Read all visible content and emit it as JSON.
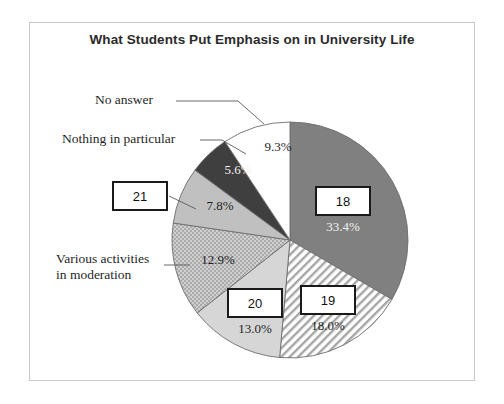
{
  "chart_data": {
    "type": "pie",
    "title": "What Students Put Emphasis on in University Life",
    "subtitle": "",
    "xlabel": "",
    "ylabel": "",
    "grid": false,
    "legend_position": "none",
    "total_percent": 100.0,
    "start_angle_deg": 0,
    "direction": "clockwise",
    "categories": [
      "18",
      "19",
      "20",
      "Various activities in moderation",
      "21",
      "Nothing in particular",
      "No answer"
    ],
    "values": [
      33.4,
      18.0,
      13.0,
      12.9,
      7.8,
      5.6,
      9.3
    ],
    "slices": [
      {
        "label": "18",
        "label_kind": "boxed-number",
        "percent": 33.4,
        "percent_text": "33.4%",
        "fill": "#808080",
        "pattern": "solid",
        "percent_text_color": "#f2f2f2"
      },
      {
        "label": "19",
        "label_kind": "boxed-number",
        "percent": 18.0,
        "percent_text": "18.0%",
        "fill": "#ffffff",
        "pattern": "diagonal-hatch",
        "percent_text_color": "#1f1f1f"
      },
      {
        "label": "20",
        "label_kind": "boxed-number",
        "percent": 13.0,
        "percent_text": "13.0%",
        "fill": "#d6d6d6",
        "pattern": "solid",
        "percent_text_color": "#1f1f1f"
      },
      {
        "label": "Various activities in moderation",
        "label_kind": "callout-text",
        "percent": 12.9,
        "percent_text": "12.9%",
        "fill": "#c4c4c4",
        "pattern": "stipple-dots",
        "percent_text_color": "#1f1f1f"
      },
      {
        "label": "21",
        "label_kind": "boxed-number",
        "percent": 7.8,
        "percent_text": "7.8%",
        "fill": "#c0c0c0",
        "pattern": "solid",
        "percent_text_color": "#1f1f1f"
      },
      {
        "label": "Nothing in particular",
        "label_kind": "callout-text",
        "percent": 5.6,
        "percent_text": "5.6%",
        "fill": "#3f3f3f",
        "pattern": "solid",
        "percent_text_color": "#f2f2f2"
      },
      {
        "label": "No answer",
        "label_kind": "callout-text",
        "percent": 9.3,
        "percent_text": "9.3%",
        "fill": "#ffffff",
        "pattern": "solid",
        "percent_text_color": "#1f1f1f"
      }
    ]
  },
  "labels": {
    "no_answer": "No answer",
    "nothing_in_particular": "Nothing in particular",
    "various_activities_line1": "Various activities",
    "various_activities_line2": "in moderation",
    "box_18": "18",
    "box_19": "19",
    "box_20": "20",
    "box_21": "21"
  },
  "percents": {
    "p18": "33.4%",
    "p19": "18.0%",
    "p20": "13.0%",
    "p_various": "12.9%",
    "p21": "7.8%",
    "p_nothing": "5.6%",
    "p_no_answer": "9.3%"
  },
  "colors": {
    "slice_18": "#808080",
    "slice_19_hatch": "#9a9a9a",
    "slice_20": "#d6d6d6",
    "slice_various": "#c4c4c4",
    "slice_21": "#c0c0c0",
    "slice_nothing": "#3f3f3f",
    "slice_no_answer": "#ffffff",
    "outline": "#6e6e6e",
    "frame": "#c9c9c9",
    "title_text": "#2b2b2b",
    "label_text": "#1f1f1f",
    "box_border": "#1a1a1a"
  }
}
